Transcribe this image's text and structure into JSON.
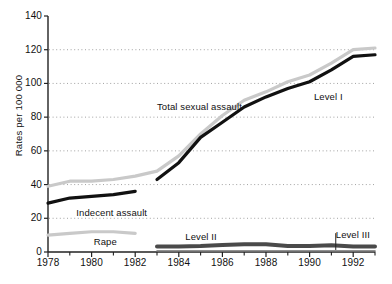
{
  "chart_data": {
    "type": "line",
    "title": "",
    "xlabel": "",
    "ylabel": "Rates per 100 000",
    "xlim": [
      1978,
      1993
    ],
    "ylim": [
      0,
      140
    ],
    "grid": "horizontal-dotted",
    "legend": "inline-annotations",
    "x": [
      1978,
      1979,
      1980,
      1981,
      1982,
      1983,
      1984,
      1985,
      1986,
      1987,
      1988,
      1989,
      1990,
      1991,
      1992,
      1993
    ],
    "yticks": [
      0,
      20,
      40,
      60,
      80,
      100,
      120,
      140
    ],
    "ytick_labels": [
      "0",
      "20",
      "40",
      "60",
      "80",
      "100",
      "120",
      "140"
    ],
    "xticks_major": [
      1978,
      1980,
      1982,
      1984,
      1986,
      1988,
      1990,
      1992
    ],
    "xtick_labels": [
      "1978",
      "1980",
      "1982",
      "1984",
      "1986",
      "1988",
      "1990",
      "1992"
    ],
    "xticks_minor": [
      1979,
      1981,
      1983,
      1985,
      1987,
      1989,
      1991,
      1993
    ],
    "series": [
      {
        "name": "Total sexual assault",
        "color": "#c9c9c9",
        "style": "thick-line",
        "x": [
          1978,
          1979,
          1980,
          1981,
          1982,
          1983,
          1984,
          1985,
          1986,
          1987,
          1988,
          1989,
          1990,
          1991,
          1992,
          1993
        ],
        "values": [
          39,
          42,
          42,
          43,
          45,
          48,
          57,
          70,
          81,
          90,
          95,
          101,
          105,
          112,
          120,
          121
        ]
      },
      {
        "name": "Indecent assault",
        "color": "#111111",
        "style": "thick-line",
        "x": [
          1978,
          1979,
          1980,
          1981,
          1982
        ],
        "values": [
          29,
          32,
          33,
          34,
          36
        ]
      },
      {
        "name": "Level I",
        "color": "#111111",
        "style": "thick-line",
        "x": [
          1983,
          1984,
          1985,
          1986,
          1987,
          1988,
          1989,
          1990,
          1991,
          1992,
          1993
        ],
        "values": [
          43,
          53,
          68,
          77,
          86,
          92,
          97,
          101,
          108,
          116,
          117
        ]
      },
      {
        "name": "Rape",
        "color": "#c9c9c9",
        "style": "thick-line",
        "x": [
          1978,
          1979,
          1980,
          1981,
          1982
        ],
        "values": [
          10,
          11,
          12,
          12,
          11
        ]
      },
      {
        "name": "Level II",
        "color": "#4a4a4a",
        "style": "thick-line",
        "x": [
          1983,
          1984,
          1985,
          1986,
          1987,
          1988,
          1989,
          1990,
          1991,
          1992,
          1993
        ],
        "values": [
          3.2,
          3.3,
          3.6,
          4.2,
          4.6,
          4.6,
          3.6,
          3.6,
          4.0,
          3.3,
          3.2
        ]
      },
      {
        "name": "Level III",
        "color": "#6e6e6e",
        "style": "thin-line-near-zero",
        "x": [
          1983,
          1984,
          1985,
          1986,
          1987,
          1988,
          1989,
          1990,
          1991,
          1992,
          1993
        ],
        "values": [
          0.5,
          0.5,
          0.5,
          0.5,
          0.5,
          0.5,
          0.5,
          0.5,
          0.5,
          0.5,
          0.5
        ]
      }
    ],
    "annotations": [
      {
        "name": "total-sexual-assault",
        "text": "Total sexual assault",
        "x": 1983.0,
        "y": 86
      },
      {
        "name": "level-i",
        "text": "Level I",
        "x": 1990.2,
        "y": 92
      },
      {
        "name": "indecent-assault",
        "text": "Indecent assault",
        "x": 1979.3,
        "y": 23
      },
      {
        "name": "rape",
        "text": "Rape",
        "x": 1980.1,
        "y": 6
      },
      {
        "name": "level-ii",
        "text": "Level II",
        "x": 1984.3,
        "y": 9
      },
      {
        "name": "level-iii",
        "text": "Level III",
        "x": 1991.2,
        "y": 10
      }
    ]
  }
}
